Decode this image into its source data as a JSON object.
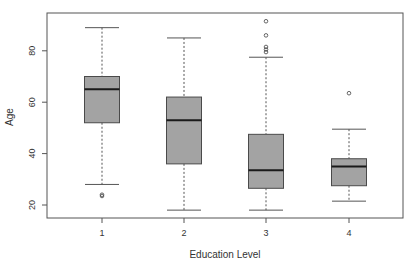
{
  "chart_data": {
    "type": "boxplot",
    "title": "",
    "xlabel": "Education Level",
    "ylabel": "Age",
    "categories": [
      "1",
      "2",
      "3",
      "4"
    ],
    "yticks": [
      20,
      40,
      60,
      80
    ],
    "ylim": [
      15,
      95
    ],
    "grid": false,
    "legend": null,
    "boxes": [
      {
        "category": "1",
        "whisker_low": 28,
        "q1": 52,
        "median": 65,
        "q3": 70,
        "whisker_high": 89,
        "outliers": [
          23.5,
          24
        ]
      },
      {
        "category": "2",
        "whisker_low": 18,
        "q1": 36,
        "median": 53,
        "q3": 62,
        "whisker_high": 85,
        "outliers": []
      },
      {
        "category": "3",
        "whisker_low": 18,
        "q1": 26.5,
        "median": 33.5,
        "q3": 47.5,
        "whisker_high": 77.5,
        "outliers": [
          79.5,
          80.5,
          81.5,
          86,
          91.5
        ]
      },
      {
        "category": "4",
        "whisker_low": 21.5,
        "q1": 27.5,
        "median": 35,
        "q3": 38,
        "whisker_high": 49.5,
        "outliers": [
          63.5
        ]
      }
    ],
    "colors": {
      "box_fill": "#a3a3a3",
      "box_stroke": "#4a4a4a",
      "median": "#1a1a1a",
      "axis": "#555555"
    }
  }
}
